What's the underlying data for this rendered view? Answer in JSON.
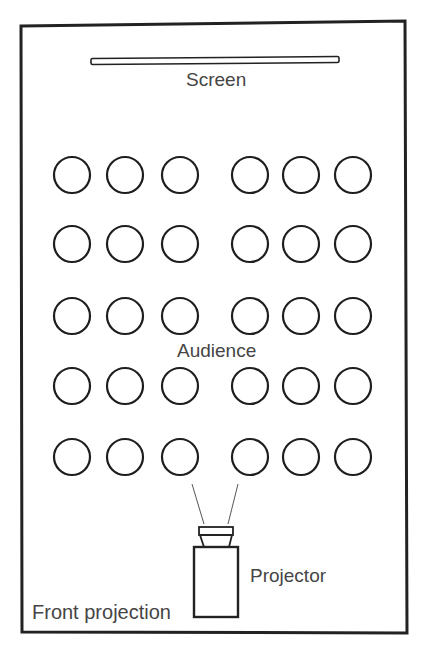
{
  "diagram": {
    "title": "Front projection",
    "labels": {
      "screen": "Screen",
      "audience": "Audience",
      "projector": "Projector"
    },
    "room": {
      "x1": 21,
      "y1": 24,
      "x2": 406,
      "y2": 633,
      "stroke": "#222222",
      "stroke_width": 3
    },
    "screen_bar": {
      "x": 91,
      "y": 57,
      "width": 248,
      "height": 6
    },
    "audience": {
      "rows": 5,
      "seats_per_row": 6,
      "column_centers": [
        72,
        125,
        180,
        250,
        301,
        353
      ],
      "row_centers": [
        175,
        244,
        316,
        386,
        457
      ],
      "seat_radius": 18,
      "aisle_between_columns": [
        3,
        4
      ]
    },
    "projector": {
      "body": {
        "x": 194,
        "y": 547,
        "width": 44,
        "height": 70
      },
      "lens_top": {
        "x": 199,
        "y": 527,
        "width": 34,
        "height": 8
      },
      "lens_base": {
        "top_left": 200,
        "top_right": 232,
        "bottom_left": 204,
        "bottom_right": 229,
        "y_top": 535,
        "y_bottom": 547
      },
      "beam_left": {
        "x1": 204,
        "y1": 524,
        "x2": 192,
        "y2": 484
      },
      "beam_right": {
        "x1": 228,
        "y1": 524,
        "x2": 238,
        "y2": 484
      }
    },
    "colors": {
      "line": "#222222",
      "text": "#454545",
      "background": "#ffffff"
    }
  }
}
